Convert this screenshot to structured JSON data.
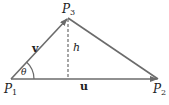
{
  "diagram": {
    "points": {
      "p1": {
        "label": "P",
        "sub": "1"
      },
      "p2": {
        "label": "P",
        "sub": "2"
      },
      "p3": {
        "label": "P",
        "sub": "3"
      }
    },
    "vectors": {
      "u": "u",
      "v": "v"
    },
    "height_label": "h",
    "angle_label": "θ",
    "colors": {
      "line": "#6b6b6b",
      "text": "#222222"
    }
  }
}
